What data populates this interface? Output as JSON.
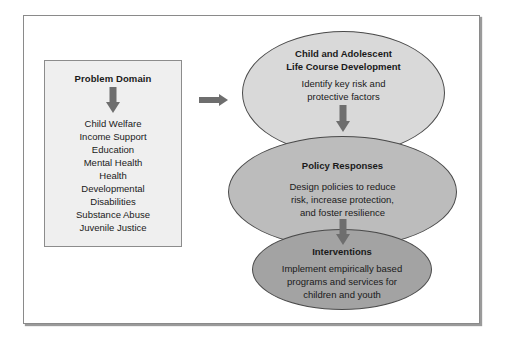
{
  "colors": {
    "arrow": "#6e6e6e",
    "problem_box_bg": "#efefef",
    "ellipse_1": "#d9d9d9",
    "ellipse_2": "#bcbcbc",
    "ellipse_3": "#a3a3a3"
  },
  "problem_domain": {
    "title": "Problem Domain",
    "items": [
      "Child Welfare",
      "Income Support",
      "Education",
      "Mental Health",
      "Health",
      "Developmental",
      "Disabilities",
      "Substance Abuse",
      "Juvenile Justice"
    ]
  },
  "stages": [
    {
      "title_line1": "Child and Adolescent",
      "title_line2": "Life Course Development",
      "body_line1": "Identify key risk and",
      "body_line2": "protective factors"
    },
    {
      "title_line1": "Policy Responses",
      "body_line1": "Design policies to reduce",
      "body_line2": "risk, increase protection,",
      "body_line3": "and foster resilience"
    },
    {
      "title_line1": "Interventions",
      "body_line1": "Implement empirically based",
      "body_line2": "programs and services for",
      "body_line3": "children and youth"
    }
  ],
  "icons": {
    "problem_arrow": "arrow-down",
    "connector_arrow": "arrow-right",
    "stage_arrow_1": "arrow-down",
    "stage_arrow_2": "arrow-down"
  }
}
